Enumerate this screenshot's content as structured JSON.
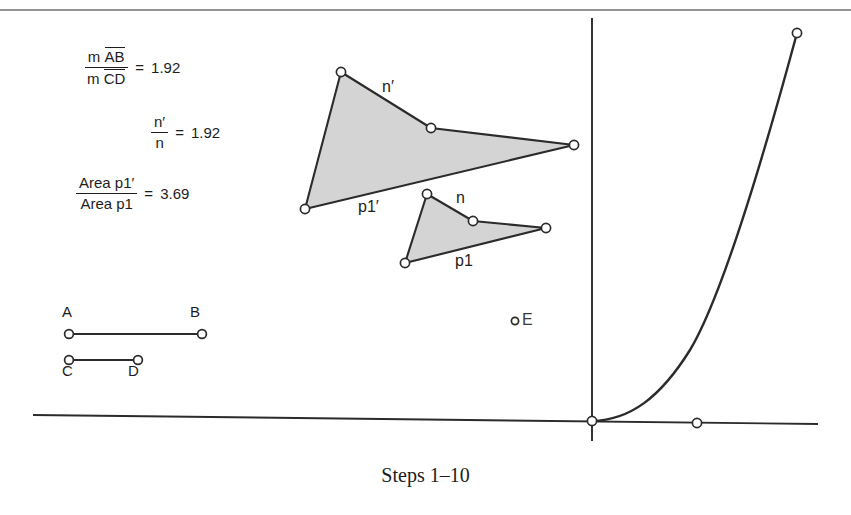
{
  "figure": {
    "caption": "Steps 1–10",
    "background_color": "#ffffff",
    "stroke_color": "#2b2b2b",
    "polygon_fill": "#d4d4d4",
    "point_fill": "#ffffff"
  },
  "measurements": [
    {
      "id": "ratio-ab-cd",
      "numerator_prefix": "m",
      "numerator_segment": "AB",
      "denominator_prefix": "m",
      "denominator_segment": "CD",
      "equals": "=",
      "value": "1.92"
    },
    {
      "id": "ratio-n-prime-n",
      "numerator": "n′",
      "denominator": "n",
      "equals": "=",
      "value": "1.92"
    },
    {
      "id": "ratio-area-p1",
      "numerator": "Area p1′",
      "denominator": "Area p1",
      "equals": "=",
      "value": "3.69"
    }
  ],
  "segments": [
    {
      "name": "segment-ab",
      "endpoint_labels": [
        "A",
        "B"
      ],
      "x1": 69,
      "y1": 334,
      "x2": 202,
      "y2": 334,
      "label_positions": [
        {
          "text": "A",
          "x": 62,
          "y": 305
        },
        {
          "text": "B",
          "x": 190,
          "y": 305
        }
      ]
    },
    {
      "name": "segment-cd",
      "endpoint_labels": [
        "C",
        "D"
      ],
      "x1": 69,
      "y1": 360,
      "x2": 138,
      "y2": 360,
      "label_positions": [
        {
          "text": "C",
          "x": 62,
          "y": 364
        },
        {
          "text": "D",
          "x": 128,
          "y": 364
        }
      ]
    }
  ],
  "polygons": [
    {
      "name": "polygon-p1-prime",
      "label": "p1′",
      "side_label": "n′",
      "label_x": 358,
      "label_y": 198,
      "side_label_x": 382,
      "side_label_y": 78,
      "vertices": [
        {
          "x": 341,
          "y": 72
        },
        {
          "x": 431,
          "y": 128
        },
        {
          "x": 574,
          "y": 145
        },
        {
          "x": 305,
          "y": 209
        }
      ]
    },
    {
      "name": "polygon-p1",
      "label": "p1",
      "side_label": "n",
      "label_x": 455,
      "label_y": 252,
      "side_label_x": 456,
      "side_label_y": 189,
      "vertices": [
        {
          "x": 427,
          "y": 194
        },
        {
          "x": 473,
          "y": 221
        },
        {
          "x": 546,
          "y": 228
        },
        {
          "x": 405,
          "y": 263
        }
      ]
    }
  ],
  "axes": {
    "x_axis": {
      "x1": 33,
      "y1": 415,
      "x2": 818,
      "y2": 424
    },
    "y_axis": {
      "x1": 592,
      "y1": 18,
      "x2": 592,
      "y2": 441
    },
    "origin": {
      "x": 592,
      "y": 421
    }
  },
  "curve": {
    "name": "exponential-curve",
    "path": "M 592 421 C 630 420 660 398 690 350 C 720 300 760 170 797 33",
    "endpoint": {
      "x": 797,
      "y": 33
    }
  },
  "free_points": [
    {
      "name": "point-e",
      "label": "E",
      "x": 515,
      "y": 321,
      "label_x": 522,
      "label_y": 311
    },
    {
      "name": "point-origin",
      "label": "",
      "x": 592,
      "y": 421
    },
    {
      "name": "point-x-axis",
      "label": "",
      "x": 697,
      "y": 423
    },
    {
      "name": "point-curve-end",
      "label": "",
      "x": 797,
      "y": 33
    }
  ],
  "frame": {
    "top_border": true,
    "top_border_y": 10
  }
}
